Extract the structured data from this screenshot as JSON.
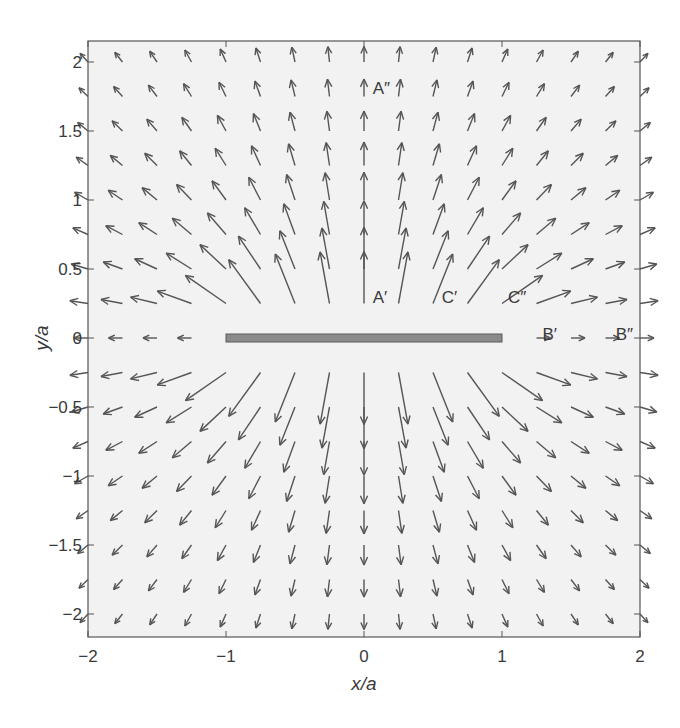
{
  "chart_data": {
    "type": "quiver",
    "title": "",
    "xlabel": "x/a",
    "ylabel": "y/a",
    "xlim": [
      -2,
      2
    ],
    "ylim": [
      -2.15,
      2.15
    ],
    "xticks": [
      -2,
      -1,
      0,
      1,
      2
    ],
    "xtick_labels": [
      "−2",
      "−1",
      "0",
      "1",
      "2"
    ],
    "yticks": [
      -2,
      -1.5,
      -1,
      -0.5,
      0,
      0.5,
      1,
      1.5,
      2
    ],
    "ytick_labels": [
      "−2",
      "−1.5",
      "−1",
      "−0.5",
      "0",
      "0.5",
      "1",
      "1.5",
      "2"
    ],
    "grid": false,
    "legend": null,
    "quiver_grid": {
      "x_start": -2,
      "x_end": 2,
      "y_start": -2,
      "y_end": 2,
      "step": 0.25
    },
    "field_description": "Velocity/field vectors directed away from a horizontal strip, strongest near the strip's faces, pointing +y above and -y below",
    "strip": {
      "x_min": -1,
      "x_max": 1,
      "y": 0,
      "fill": "#8a8a8a",
      "stroke": "#5a5a5a"
    },
    "annotations": [
      {
        "text": "A″",
        "x": 0.02,
        "y": 1.78
      },
      {
        "text": "A′",
        "x": 0.02,
        "y": 0.27
      },
      {
        "text": "C′",
        "x": 0.52,
        "y": 0.27
      },
      {
        "text": "C″",
        "x": 1.0,
        "y": 0.27
      },
      {
        "text": "B′",
        "x": 1.25,
        "y": 0.0
      },
      {
        "text": "B″",
        "x": 1.78,
        "y": 0.0
      }
    ]
  },
  "colors": {
    "plot_bg": "#f2f2f2",
    "axes": "#555555",
    "arrow": "#555555"
  }
}
